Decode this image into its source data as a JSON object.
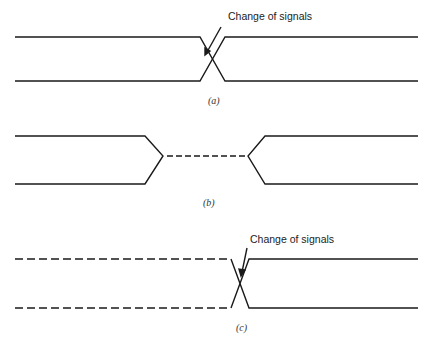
{
  "diagrams": [
    {
      "id": "a",
      "caption": "(a)",
      "annotation": "Change of signals",
      "description": "Two solid signal lines crossing over (transition)"
    },
    {
      "id": "b",
      "caption": "(b)",
      "annotation": null,
      "description": "Two solid lines converging to a dashed midline (high-impedance / undefined) and diverging again"
    },
    {
      "id": "c",
      "caption": "(c)",
      "annotation": "Change of signals",
      "description": "Dashed lines (don't care) crossing into solid lines"
    }
  ],
  "colors": {
    "line": "#1a1a1a",
    "background": "#ffffff"
  }
}
